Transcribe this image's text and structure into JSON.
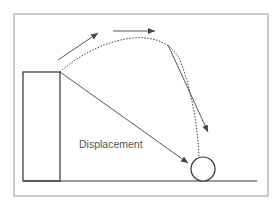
{
  "diagram": {
    "label": "Displacement",
    "colors": {
      "stroke": "#444444",
      "frame": "#888888",
      "text": "#555555"
    }
  }
}
